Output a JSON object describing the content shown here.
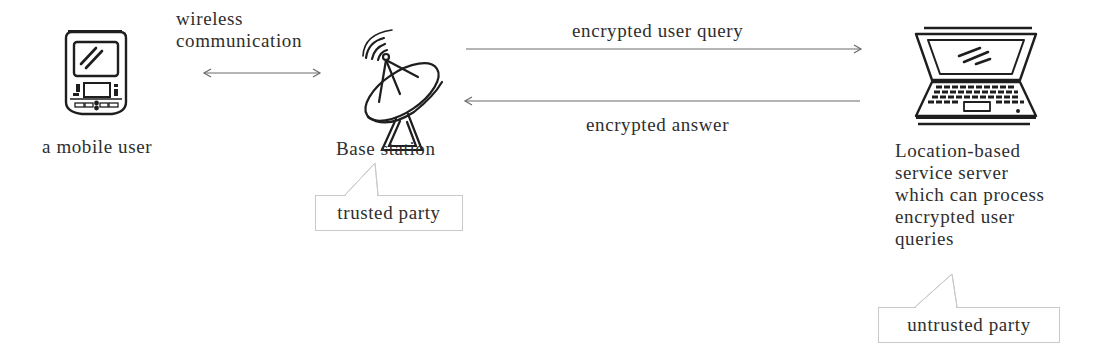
{
  "diagram": {
    "nodes": {
      "mobile_user": {
        "label": "a mobile user",
        "icon": "pda-mobile-device-icon"
      },
      "base_station": {
        "label": "Base station",
        "icon": "satellite-dish-icon"
      },
      "server": {
        "label": "Location-based\nservice server\nwhich can process\nencrypted user\nqueries",
        "icon": "laptop-icon"
      }
    },
    "edges": {
      "wireless": {
        "label": "wireless\ncommunication",
        "direction": "bidirectional"
      },
      "query": {
        "label": "encrypted user query",
        "direction": "base_station->server"
      },
      "answer": {
        "label": "encrypted answer",
        "direction": "server->base_station"
      }
    },
    "callouts": {
      "trusted": {
        "label": "trusted party",
        "target": "base_station"
      },
      "untrusted": {
        "label": "untrusted party",
        "target": "server"
      }
    },
    "colors": {
      "stroke": "#1e1e1e",
      "arrow": "#6a6a6a",
      "callout_border": "#c9c9c9",
      "text": "#2e2e2e"
    }
  }
}
